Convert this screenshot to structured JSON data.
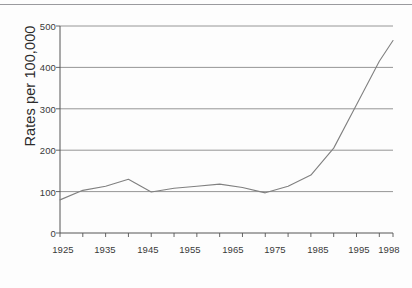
{
  "chart_data": {
    "type": "line",
    "title": "",
    "subtitle": "",
    "xlabel": "",
    "ylabel": "Rates per 100,000",
    "xlim": [
      1925,
      1998
    ],
    "ylim": [
      0,
      500
    ],
    "grid": true,
    "grid_axis": "y",
    "legend": "none",
    "y_ticks": [
      0,
      100,
      200,
      300,
      400,
      500
    ],
    "y_tick_labels": [
      "0",
      "100",
      "200",
      "300",
      "400",
      "500"
    ],
    "x_ticks": [
      1925,
      1930,
      1935,
      1940,
      1945,
      1950,
      1955,
      1960,
      1965,
      1970,
      1975,
      1980,
      1985,
      1990,
      1995,
      1998
    ],
    "x_tick_labels_shown": [
      "1925",
      "1935",
      "1945",
      "1955",
      "1965",
      "1975",
      "1985",
      "1995",
      "1998"
    ],
    "x_tick_labels_shown_values": [
      1925,
      1935,
      1945,
      1955,
      1965,
      1975,
      1985,
      1995,
      1998
    ],
    "series": [
      {
        "name": "Rate",
        "color": "#808080",
        "x": [
          1925,
          1930,
          1935,
          1940,
          1945,
          1950,
          1955,
          1960,
          1965,
          1970,
          1975,
          1980,
          1985,
          1990,
          1995,
          1998
        ],
        "values": [
          80,
          103,
          113,
          130,
          99,
          108,
          113,
          118,
          110,
          97,
          113,
          140,
          205,
          310,
          415,
          465
        ]
      }
    ]
  },
  "axes": {
    "y_title": "Rates per 100,000",
    "y_labels": [
      "500",
      "400",
      "300",
      "200",
      "100",
      "0"
    ],
    "x_labels": [
      "1925",
      "1935",
      "1945",
      "1955",
      "1965",
      "1975",
      "1985",
      "1995",
      "1998"
    ]
  },
  "colors": {
    "line": "#808080",
    "grid": "#8a8a8a",
    "axis": "#555555",
    "text": "#3a3a3a",
    "background": "#fdfdfd",
    "top_rule": "#9a9a9e"
  }
}
